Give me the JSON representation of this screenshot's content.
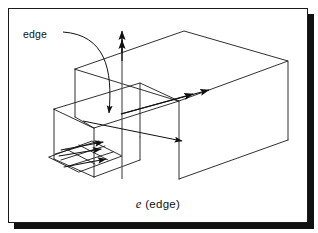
{
  "figure": {
    "caption": {
      "symbol": "e",
      "parenthetical": "(edge)",
      "full": "e (edge)"
    },
    "annotations": [
      {
        "id": "edge-callout",
        "label": "edge",
        "leader": "curved-arrow-down"
      }
    ],
    "colors": {
      "stroke": "#1a1a1a",
      "background": "#ffffff",
      "shadow": "#111111",
      "frame_border": "#1a1a1a"
    },
    "geometry": {
      "outer_box": "large isometric rectangular box (right/main volume)",
      "inner_box": "smaller nested isometric box (left/front volume)",
      "ground_plane": "small flat parallelogram grid at lower-left"
    },
    "arrows": [
      {
        "id": "vertical-arrow",
        "direction": "up",
        "heads": 2,
        "style": "double-arrowhead"
      },
      {
        "id": "diagonal-arrow",
        "direction": "up-right",
        "heads": 2,
        "style": "double-arrowhead"
      },
      {
        "id": "depth-arrow",
        "direction": "down-right",
        "heads": 1,
        "style": "single-arrowhead"
      },
      {
        "id": "callout-arrow",
        "direction": "down",
        "heads": 1,
        "style": "curved-leader"
      },
      {
        "id": "plane-arrow-a",
        "direction": "right",
        "heads": 1,
        "style": "single-arrowhead"
      },
      {
        "id": "plane-arrow-b",
        "direction": "right",
        "heads": 1,
        "style": "single-arrowhead"
      },
      {
        "id": "plane-arrow-c",
        "direction": "right",
        "heads": 1,
        "style": "single-arrowhead"
      }
    ]
  }
}
